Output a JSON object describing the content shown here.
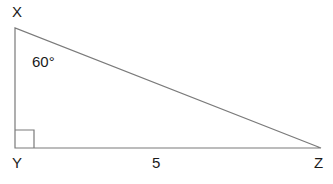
{
  "diagram": {
    "type": "right-triangle",
    "vertices": [
      {
        "id": "X",
        "label": "X",
        "x": 15,
        "y": 28
      },
      {
        "id": "Y",
        "label": "Y",
        "x": 15,
        "y": 148
      },
      {
        "id": "Z",
        "label": "Z",
        "x": 321,
        "y": 148
      }
    ],
    "right_angle_at": "Y",
    "angle_label": "60°",
    "angle_at": "X",
    "side_label": "5",
    "side": "YZ",
    "colors": {
      "line": "#7a7a7a",
      "text": "#1a1a1a"
    }
  }
}
